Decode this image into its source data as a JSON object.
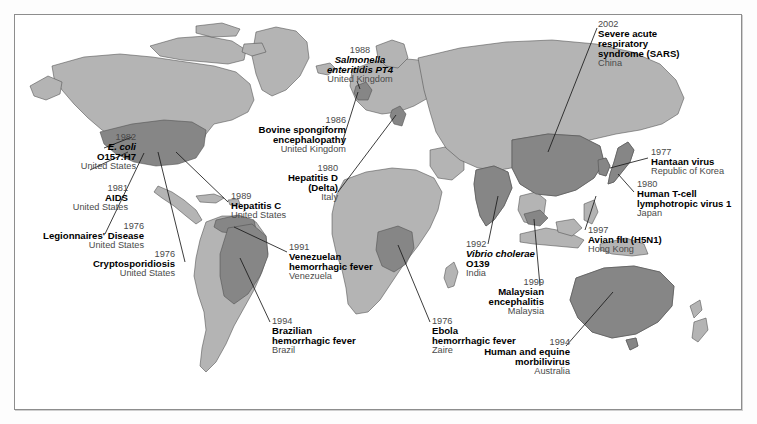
{
  "figure": {
    "kind": "world-map-infographic",
    "colors": {
      "background": "#ffffff",
      "land_base": "#b4b4b4",
      "land_highlight": "#868686",
      "coastline": "#4d4d4d",
      "frame": "#8d8d8d",
      "year_text": "#4a4a4a",
      "disease_text": "#000000",
      "leader_line": "#1a1a1a"
    }
  },
  "labels": [
    {
      "id": "ecoli",
      "year": "1982",
      "name": "E. coli\nO157:H7",
      "name_line1": "E. coli",
      "name_line2": "O157:H7",
      "italic_line1": true,
      "country": "United States",
      "align": "right"
    },
    {
      "id": "aids",
      "year": "1981",
      "name": "AIDS",
      "country": "United States",
      "align": "right"
    },
    {
      "id": "legionnaires",
      "year": "1976",
      "name": "Legionnaires' Disease",
      "country": "United States",
      "align": "right"
    },
    {
      "id": "crypto",
      "year": "1976",
      "name": "Cryptosporidiosis",
      "country": "United States",
      "align": "right"
    },
    {
      "id": "hepc",
      "year": "1989",
      "name": "Hepatitis C",
      "country": "United States",
      "align": "left"
    },
    {
      "id": "bse",
      "year": "1986",
      "name_line1": "Bovine spongiform",
      "name_line2": "encephalopathy",
      "country": "United Kingdom",
      "align": "right"
    },
    {
      "id": "salmonella",
      "year": "1988",
      "name_line1": "Salmonella",
      "name_line2": "enteritidis PT4",
      "italic_line1": true,
      "italic_line2": "partial",
      "country": "United Kingdom",
      "align": "center"
    },
    {
      "id": "hepd",
      "year": "1980",
      "name_line1": "Hepatitis D",
      "name_line2": "(Delta)",
      "country": "Italy",
      "align": "right"
    },
    {
      "id": "venezuelan",
      "year": "1991",
      "name_line1": "Venezuelan",
      "name_line2": "hemorrhagic fever",
      "country": "Venezuela",
      "align": "left"
    },
    {
      "id": "brazilian",
      "year": "1994",
      "name_line1": "Brazilian",
      "name_line2": "hemorrhagic fever",
      "country": "Brazil",
      "align": "left"
    },
    {
      "id": "ebola",
      "year": "1976",
      "name_line1": "Ebola",
      "name_line2": "hemorrhagic fever",
      "country": "Zaire",
      "align": "left"
    },
    {
      "id": "vibrio",
      "year": "1992",
      "name_line1": "Vibrio cholerae",
      "name_line2": "O139",
      "italic_line1": true,
      "country": "India",
      "align": "left"
    },
    {
      "id": "sars",
      "year": "2002",
      "name_line1": "Severe acute",
      "name_line2": "respiratory",
      "name_line3": "syndrome (SARS)",
      "country": "China",
      "align": "left"
    },
    {
      "id": "hantaan",
      "year": "1977",
      "name": "Hantaan virus",
      "country": "Republic of Korea",
      "align": "left"
    },
    {
      "id": "htlv",
      "year": "1980",
      "name_line1": "Human T-cell",
      "name_line2": "lymphotropic virus 1",
      "country": "Japan",
      "align": "left"
    },
    {
      "id": "avianflu",
      "year": "1997",
      "name": "Avian flu (H5N1)",
      "country": "Hong Kong",
      "align": "left"
    },
    {
      "id": "malaysian",
      "year": "1999",
      "name_line1": "Malaysian",
      "name_line2": "encephalitis",
      "country": "Malaysia",
      "align": "right"
    },
    {
      "id": "morbilli",
      "year": "1994",
      "name_line1": "Human and equine",
      "name_line2": "morbilivirus",
      "country": "Australia",
      "align": "right"
    }
  ],
  "highlighted_countries": [
    "United States",
    "Venezuela",
    "Brazil",
    "United Kingdom",
    "Italy",
    "Zaire",
    "India",
    "China",
    "Republic of Korea",
    "Japan",
    "Hong Kong",
    "Malaysia",
    "Australia"
  ]
}
